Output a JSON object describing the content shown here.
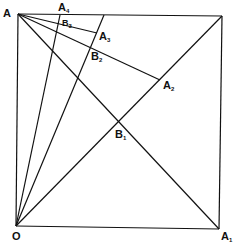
{
  "figure": {
    "type": "geometric-construction",
    "points": {
      "A": {
        "label": "A",
        "sub": ""
      },
      "O": {
        "label": "O",
        "sub": ""
      },
      "A1": {
        "label": "A",
        "sub": "1"
      },
      "A2": {
        "label": "A",
        "sub": "2"
      },
      "A3": {
        "label": "A",
        "sub": "3"
      },
      "A4": {
        "label": "A",
        "sub": "4"
      },
      "B1": {
        "label": "B",
        "sub": "1"
      },
      "B2": {
        "label": "B",
        "sub": "2"
      },
      "B3": {
        "label": "B",
        "sub": "3"
      }
    },
    "segments": [
      [
        "A",
        "TR"
      ],
      [
        "TR",
        "A1"
      ],
      [
        "O",
        "A1"
      ],
      [
        "A",
        "O"
      ],
      [
        "A",
        "A1"
      ],
      [
        "O",
        "TR"
      ],
      [
        "A",
        "A2"
      ],
      [
        "A",
        "A3"
      ],
      [
        "O",
        "A4"
      ],
      [
        "O",
        "T3"
      ]
    ]
  }
}
